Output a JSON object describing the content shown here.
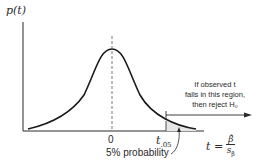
{
  "diagram": {
    "y_axis_label": "p(t)",
    "x_tick_zero": "0",
    "x_tick_crit": "t",
    "x_tick_crit_sub": ".05",
    "x_axis_label_lhs": "t =",
    "x_axis_label_num": "β̂",
    "x_axis_label_den": "s",
    "x_axis_label_den_sub": "β̂",
    "annotation_lines": [
      "If observed t",
      "falls in this region,",
      "then reject H₀"
    ],
    "tail_label": "5% probability",
    "colors": {
      "ink": "#2a2a2a",
      "tail_fill": "#e6e6e6"
    }
  }
}
